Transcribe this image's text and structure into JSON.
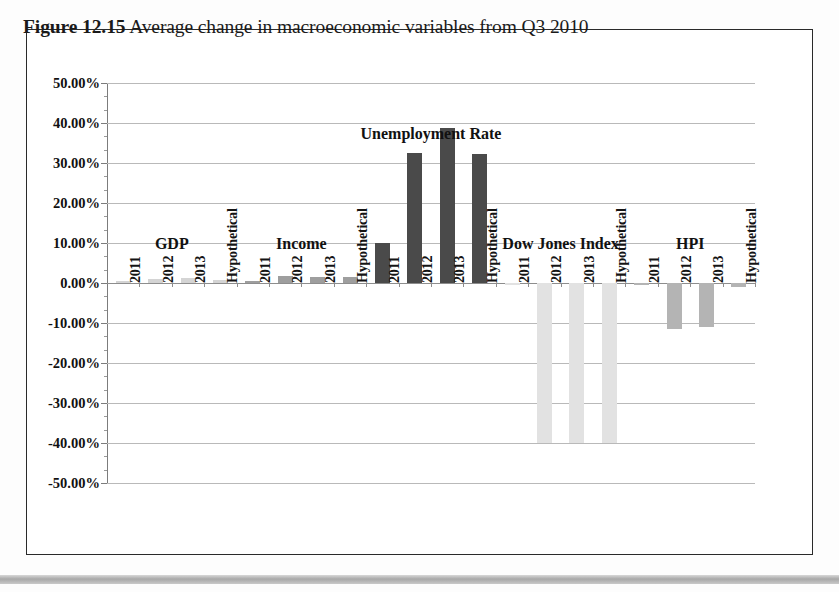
{
  "figure": {
    "number": "Figure 12.15",
    "caption": "Average change in macroeconomic variables from Q3 2010"
  },
  "chart_data": {
    "type": "bar",
    "title": "Average change in macroeconomic variables from Q3 2010",
    "xlabel": "",
    "ylabel": "",
    "ylim": [
      -50,
      50
    ],
    "ytick_step": 10,
    "grid": true,
    "legend": false,
    "categories": [
      "2011",
      "2012",
      "2013",
      "Hypothetical"
    ],
    "groups": [
      {
        "name": "GDP",
        "color": "#d4d4d4",
        "values": [
          0.4,
          1.0,
          1.2,
          0.8
        ]
      },
      {
        "name": "Income",
        "color": "#9e9e9e",
        "values": [
          0.5,
          1.8,
          1.6,
          1.4
        ]
      },
      {
        "name": "Unemployment Rate",
        "color": "#4a4a4a",
        "values": [
          10.0,
          32.5,
          38.7,
          32.3
        ]
      },
      {
        "name": "Dow Jones Index",
        "color": "#e2e2e2",
        "values": [
          -0.5,
          -40.0,
          -40.0,
          -40.0
        ]
      },
      {
        "name": "HPI",
        "color": "#b4b4b4",
        "values": [
          -0.6,
          -11.5,
          -11.0,
          -0.9
        ]
      }
    ],
    "ytick_labels": [
      "50.00%",
      "40.00%",
      "30.00%",
      "20.00%",
      "10.00%",
      "0.00%",
      "-10.00%",
      "-20.00%",
      "-30.00%",
      "-40.00%",
      "-50.00%"
    ],
    "ytick_values": [
      50,
      40,
      30,
      20,
      10,
      0,
      -10,
      -20,
      -30,
      -40,
      -50
    ]
  }
}
